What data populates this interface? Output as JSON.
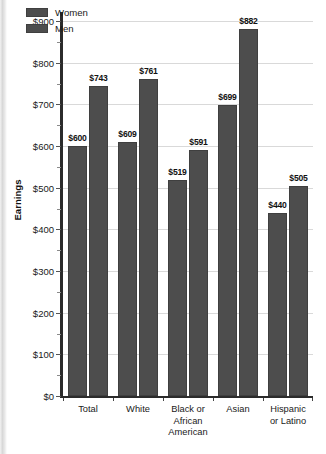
{
  "chart_data": {
    "type": "bar",
    "title": "",
    "xlabel": "",
    "ylabel": "Earnings",
    "ylim": [
      0,
      900
    ],
    "ytick_step": 100,
    "yminor_step": 50,
    "grid": true,
    "legend_position": "top-left",
    "value_prefix": "$",
    "categories": [
      "Total",
      "White",
      "Black or African American",
      "Asian",
      "Hispanic or Latino"
    ],
    "category_lines": [
      [
        "Total"
      ],
      [
        "White"
      ],
      [
        "Black or",
        "African",
        "American"
      ],
      [
        "Asian"
      ],
      [
        "Hispanic",
        "or Latino"
      ]
    ],
    "series": [
      {
        "name": "Women",
        "color": "#4d4d4d",
        "values": [
          600,
          609,
          519,
          699,
          440
        ],
        "labels": [
          "$600",
          "$609",
          "$519",
          "$699",
          "$440"
        ]
      },
      {
        "name": "Men",
        "color": "#4d4d4d",
        "values": [
          743,
          761,
          591,
          882,
          505
        ],
        "labels": [
          "$743",
          "$761",
          "$591",
          "$882",
          "$505"
        ]
      }
    ],
    "ytick_labels": [
      "$0",
      "$100",
      "$200",
      "$300",
      "$400",
      "$500",
      "$600",
      "$700",
      "$800",
      "$900"
    ],
    "ytick_values": [
      0,
      100,
      200,
      300,
      400,
      500,
      600,
      700,
      800,
      900
    ]
  },
  "legend": {
    "items": [
      {
        "label": "Women",
        "color": "#4d4d4d"
      },
      {
        "label": "Men",
        "color": "#4d4d4d"
      }
    ]
  },
  "colors": {
    "bar": "#4d4d4d",
    "bar_border": "#3f3f3f",
    "axis": "#2b2b2b",
    "gridline": "#d9d9d9",
    "text": "#1a1a1a"
  }
}
